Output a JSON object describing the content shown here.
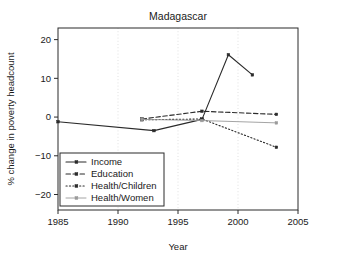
{
  "chart_data": {
    "type": "line",
    "title": "Madagascar",
    "xlabel": "Year",
    "ylabel": "% change in poverty headcount",
    "xlim": [
      1985,
      2005
    ],
    "ylim": [
      -24,
      23
    ],
    "xticks": [
      1985,
      1990,
      1995,
      2000,
      2005
    ],
    "yticks": [
      20,
      10,
      0,
      -10,
      -20
    ],
    "xticklabels": [
      "1985",
      "1990",
      "1995",
      "2000",
      "2005"
    ],
    "yticklabels": [
      "20",
      "10",
      "0",
      "−10",
      "−20"
    ],
    "grid": "vertical-dotted",
    "legend_position": "lower-left-inside",
    "series": [
      {
        "name": "Income",
        "style": "solid",
        "color": "#2b2b2b",
        "marker": "dot",
        "points": [
          {
            "x": 1985.0,
            "y": -1.2
          },
          {
            "x": 1993.0,
            "y": -3.5
          },
          {
            "x": 1997.0,
            "y": -0.6
          },
          {
            "x": 1999.2,
            "y": 16.1
          },
          {
            "x": 2001.2,
            "y": 10.9
          }
        ]
      },
      {
        "name": "Education",
        "style": "dashed",
        "color": "#2b2b2b",
        "marker": "dot",
        "points": [
          {
            "x": 1992.0,
            "y": -0.5
          },
          {
            "x": 1997.0,
            "y": 1.5
          },
          {
            "x": 2003.2,
            "y": 0.7
          }
        ]
      },
      {
        "name": "Health/Children",
        "style": "dotted",
        "color": "#2b2b2b",
        "marker": "dot",
        "points": [
          {
            "x": 1992.0,
            "y": -0.7
          },
          {
            "x": 1997.0,
            "y": -0.5
          },
          {
            "x": 2003.2,
            "y": -7.8
          }
        ]
      },
      {
        "name": "Health/Women",
        "style": "solid-light",
        "color": "#9a9a9a",
        "marker": "dot",
        "points": [
          {
            "x": 1992.0,
            "y": -0.6
          },
          {
            "x": 1997.0,
            "y": -0.9
          },
          {
            "x": 2003.2,
            "y": -1.5
          }
        ]
      }
    ]
  }
}
